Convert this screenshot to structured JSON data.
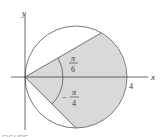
{
  "diagram": {
    "type": "polar-region",
    "axes": {
      "x_label": "x",
      "y_label": "y",
      "x_tick_label": "4"
    },
    "angles": {
      "upper": {
        "num": "π",
        "den": "6",
        "sign": ""
      },
      "lower": {
        "num": "π",
        "den": "4",
        "sign": "−"
      }
    },
    "colors": {
      "shade": "#d9d9d9",
      "stroke": "#555555",
      "axis": "#444444"
    },
    "caption": "FIGURE"
  }
}
